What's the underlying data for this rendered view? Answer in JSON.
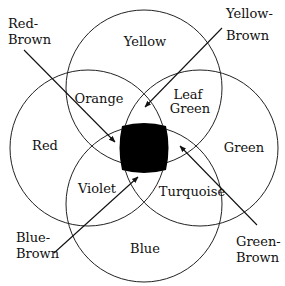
{
  "diagram": {
    "type": "venn",
    "circles": [
      {
        "name": "Yellow",
        "label": "Yellow"
      },
      {
        "name": "Red",
        "label": "Red"
      },
      {
        "name": "Green",
        "label": "Green"
      },
      {
        "name": "Blue",
        "label": "Blue"
      }
    ],
    "overlaps": {
      "red_yellow": "Orange",
      "yellow_green": [
        "Leaf",
        "Green"
      ],
      "red_blue": "Violet",
      "green_blue": "Turquoise"
    },
    "center": {
      "fill": "#000000"
    },
    "pointers": [
      {
        "lines": [
          "Red-",
          "Brown"
        ]
      },
      {
        "lines": [
          "Yellow-",
          "Brown"
        ]
      },
      {
        "lines": [
          "Blue-",
          "Brown"
        ]
      },
      {
        "lines": [
          "Green-",
          "Brown"
        ]
      }
    ]
  }
}
